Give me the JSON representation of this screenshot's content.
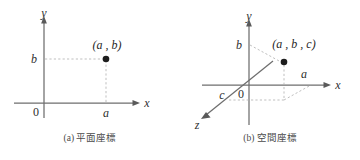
{
  "figure": {
    "kind": "coordinate-systems-illustration",
    "background_color": "#ffffff",
    "axis_color": "#6e6e6e",
    "guide_color": "#b4b4b4",
    "point_color": "#1d1d1d",
    "text_color": "#2e2e2e"
  },
  "panels": [
    {
      "id": "plane",
      "caption": "(a) 平面座標",
      "caption_index": "(a)",
      "caption_text": "平面座標",
      "axes": [
        {
          "name": "x-axis",
          "label": "x"
        },
        {
          "name": "y-axis",
          "label": "y"
        }
      ],
      "origin_label": "0",
      "tick_labels": {
        "x": "a",
        "y": "b"
      },
      "point_label": "(a , b)",
      "guides": [
        "horizontal-from-b-to-point",
        "vertical-from-a-to-point"
      ]
    },
    {
      "id": "space",
      "caption": "(b) 空間座標",
      "caption_index": "(b)",
      "caption_text": "空間座標",
      "axes": [
        {
          "name": "x-axis",
          "label": "x"
        },
        {
          "name": "y-axis",
          "label": "y"
        },
        {
          "name": "z-axis",
          "label": "z"
        }
      ],
      "origin_label": "0",
      "tick_labels": {
        "x": "a",
        "y": "b",
        "z": "c"
      },
      "point_label": "(a , b , c)",
      "guides": [
        "horizontal-from-b-to-point",
        "vertical-from-projection-to-point",
        "projection-from-a",
        "projection-from-c"
      ]
    }
  ]
}
